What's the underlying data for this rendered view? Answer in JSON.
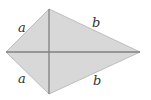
{
  "diagram": {
    "shape": "kite",
    "labels": {
      "top_left": "a",
      "bottom_left": "a",
      "top_right": "b",
      "bottom_right": "b"
    },
    "colors": {
      "fill": "#d8d8d8",
      "stroke": "#7a7a7a",
      "diagonal": "#808080"
    }
  }
}
